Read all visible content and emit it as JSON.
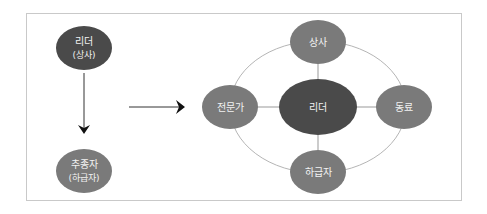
{
  "diagram": {
    "left": {
      "top_node": {
        "line1": "리더",
        "line2": "(상사)",
        "color": "#4a4a4a"
      },
      "bottom_node": {
        "line1": "추종자",
        "line2": "(하급자)",
        "color": "#7a7a7a"
      }
    },
    "right": {
      "center_node": {
        "label": "리더",
        "color": "#4a4a4a"
      },
      "top_node": {
        "label": "상사",
        "color": "#7a7a7a"
      },
      "left_node": {
        "label": "전문가",
        "color": "#7a7a7a"
      },
      "right_node": {
        "label": "동료",
        "color": "#7a7a7a"
      },
      "bottom_node": {
        "label": "하급자",
        "color": "#7a7a7a"
      }
    },
    "colors": {
      "frame": "#c9c9c9",
      "ring": "#b5b5b5",
      "arrow": "#111111"
    }
  }
}
